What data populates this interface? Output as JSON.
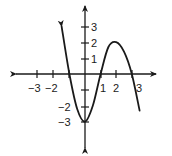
{
  "chart_data": {
    "type": "line",
    "title": "",
    "xlabel": "",
    "ylabel": "",
    "xlim": [
      -3.5,
      3.5
    ],
    "ylim": [
      -3.5,
      3.5
    ],
    "grid": false,
    "legend": null,
    "x_ticks": [
      -3,
      -2,
      -1,
      1,
      2,
      3
    ],
    "x_tick_labels": [
      "−3",
      "−2",
      "",
      "1",
      "2",
      "3"
    ],
    "y_ticks": [
      -3,
      -2,
      -1,
      1,
      2,
      3
    ],
    "y_tick_labels": [
      "−3",
      "−2",
      "",
      "1",
      "2",
      "3"
    ],
    "series": [
      {
        "name": "f(x)",
        "x": [
          -1.5,
          -1.0,
          -0.5,
          0.0,
          0.5,
          1.0,
          1.5,
          2.0,
          2.5,
          3.0,
          3.5
        ],
        "y": [
          3.0,
          0.0,
          -2.2,
          -3.0,
          -2.0,
          0.0,
          1.7,
          2.0,
          1.4,
          0.0,
          -2.3
        ],
        "arrows": "both-ends"
      }
    ],
    "annotations": {
      "local_minimum": [
        0,
        -3
      ],
      "local_maximum": [
        2,
        2
      ],
      "x_intercepts": [
        -1,
        1,
        3
      ]
    }
  },
  "labels": {
    "x_neg3": "−3",
    "x_neg2": "−2",
    "x_1": "1",
    "x_2": "2",
    "x_3": "3",
    "y_3": "3",
    "y_2": "2",
    "y_1": "1",
    "y_neg2": "−2",
    "y_neg3": "−3"
  }
}
